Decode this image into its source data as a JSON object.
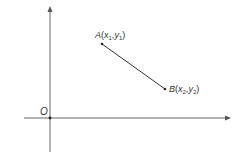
{
  "diagram": {
    "title": "",
    "origin_label": "O",
    "point_a": {
      "name": "A",
      "x_sym": "x",
      "x_sub": "1",
      "y_sym": "y",
      "y_sub": "1"
    },
    "point_b": {
      "name": "B",
      "x_sym": "x",
      "x_sub": "2",
      "y_sym": "y",
      "y_sub": "2"
    },
    "colors": {
      "axis": "#555555",
      "segment": "#333333",
      "text": "#333333"
    }
  }
}
